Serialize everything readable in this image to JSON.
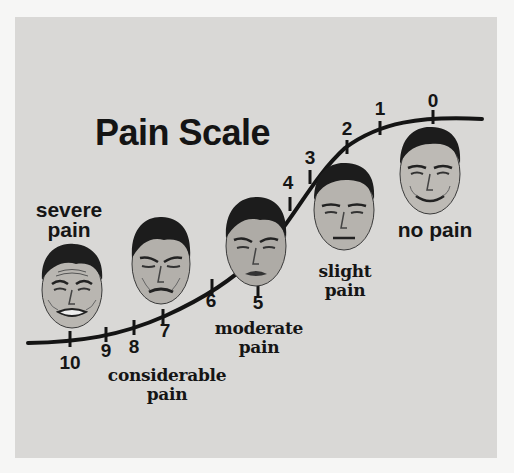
{
  "title": "Pain Scale",
  "scale": {
    "ticks": [
      {
        "value": "10",
        "x": 70,
        "y": 339,
        "lx": 70,
        "ly": 352
      },
      {
        "value": "9",
        "x": 106,
        "y": 333,
        "lx": 106,
        "ly": 340
      },
      {
        "value": "8",
        "x": 134,
        "y": 327,
        "lx": 134,
        "ly": 336
      },
      {
        "value": "7",
        "x": 163,
        "y": 317,
        "lx": 165,
        "ly": 320
      },
      {
        "value": "6",
        "x": 212,
        "y": 286,
        "lx": 211,
        "ly": 290
      },
      {
        "value": "5",
        "x": 258,
        "y": 290,
        "lx": 258,
        "ly": 292
      },
      {
        "value": "4",
        "x": 290,
        "y": 203,
        "lx": 288,
        "ly": 172
      },
      {
        "value": "3",
        "x": 310,
        "y": 175,
        "lx": 310,
        "ly": 147
      },
      {
        "value": "2",
        "x": 347,
        "y": 145,
        "lx": 347,
        "ly": 118
      },
      {
        "value": "1",
        "x": 380,
        "y": 128,
        "lx": 380,
        "ly": 98
      },
      {
        "value": "0",
        "x": 433,
        "y": 117,
        "lx": 433,
        "ly": 90
      }
    ]
  },
  "labels": {
    "severe": "severe\npain",
    "considerable_line1": "considerable",
    "considerable_line2": "pain",
    "moderate_line1": "moderate",
    "moderate_line2": "pain",
    "slight_line1": "slight",
    "slight_line2": "pain",
    "none": "no pain",
    "severe_line1": "severe",
    "severe_line2": "pain"
  },
  "faces": [
    {
      "name": "face-severe-pain",
      "expression": "severe"
    },
    {
      "name": "face-considerable-pain",
      "expression": "considerable"
    },
    {
      "name": "face-moderate-pain",
      "expression": "moderate"
    },
    {
      "name": "face-slight-pain",
      "expression": "slight"
    },
    {
      "name": "face-no-pain",
      "expression": "none"
    }
  ],
  "colors": {
    "background": "#d9d8d6",
    "ink": "#141414"
  }
}
